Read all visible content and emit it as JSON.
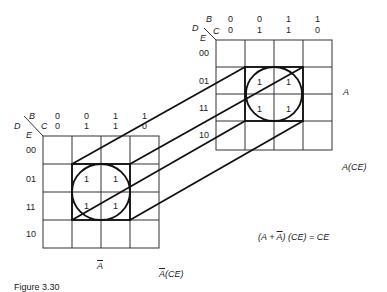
{
  "figure": {
    "caption": "Figure 3.30",
    "formula": "(A + Ā) (CE) = CE",
    "formula_parts": {
      "open": "(A + ",
      "abar": "A",
      "close": ") (CE) = CE"
    }
  },
  "right_map": {
    "label": "A",
    "expression_prefix": "A",
    "expression_suffix": "(CE)",
    "corner": {
      "d": "D",
      "b": "B",
      "c": "C",
      "e": "E"
    },
    "col_headers_B": [
      "0",
      "0",
      "1",
      "1"
    ],
    "col_headers_C": [
      "0",
      "1",
      "1",
      "0"
    ],
    "row_headers": [
      "00",
      "01",
      "11",
      "10"
    ],
    "cells": [
      [
        "",
        "",
        "",
        ""
      ],
      [
        "",
        "1",
        "1",
        ""
      ],
      [
        "",
        "1",
        "1",
        ""
      ],
      [
        "",
        "",
        "",
        ""
      ]
    ]
  },
  "left_map": {
    "label": "A",
    "label_overbar": true,
    "expression_prefix": "A",
    "expression_suffix": "(CE)",
    "corner": {
      "d": "D",
      "b": "B",
      "c": "C",
      "e": "E"
    },
    "col_headers_B": [
      "0",
      "0",
      "1",
      "1"
    ],
    "col_headers_C": [
      "0",
      "1",
      "1",
      "0"
    ],
    "row_headers": [
      "00",
      "01",
      "11",
      "10"
    ],
    "cells": [
      [
        "",
        "",
        "",
        ""
      ],
      [
        "",
        "1",
        "1",
        ""
      ],
      [
        "",
        "1",
        "1",
        ""
      ],
      [
        "",
        "",
        "",
        ""
      ]
    ]
  }
}
